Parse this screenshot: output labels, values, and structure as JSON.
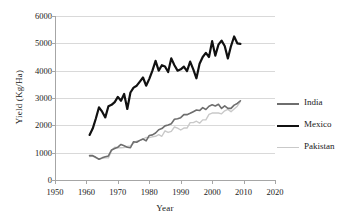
{
  "chart_data": {
    "type": "line",
    "title": "",
    "xlabel": "Year",
    "ylabel": "Yield (Kg/Ha)",
    "xlim": [
      1950,
      2020
    ],
    "ylim": [
      0,
      6000
    ],
    "xticks": [
      1950,
      1960,
      1970,
      1980,
      1990,
      2000,
      2010,
      2020
    ],
    "yticks": [
      0,
      1000,
      2000,
      3000,
      4000,
      5000,
      6000
    ],
    "grid": "horizontal",
    "legend_position": "right",
    "x": [
      1961,
      1962,
      1963,
      1964,
      1965,
      1966,
      1967,
      1968,
      1969,
      1970,
      1971,
      1972,
      1973,
      1974,
      1975,
      1976,
      1977,
      1978,
      1979,
      1980,
      1981,
      1982,
      1983,
      1984,
      1985,
      1986,
      1987,
      1988,
      1989,
      1990,
      1991,
      1992,
      1993,
      1994,
      1995,
      1996,
      1997,
      1998,
      1999,
      2000,
      2001,
      2002,
      2003,
      2004,
      2005,
      2006,
      2007,
      2008,
      2009
    ],
    "series": [
      {
        "name": "India",
        "color": "#6e6e6e",
        "width": 1.6,
        "values": [
          890,
          890,
          830,
          760,
          810,
          850,
          880,
          1100,
          1150,
          1200,
          1300,
          1250,
          1200,
          1180,
          1400,
          1380,
          1450,
          1500,
          1430,
          1630,
          1650,
          1720,
          1840,
          1880,
          1980,
          2010,
          2060,
          2220,
          2240,
          2280,
          2390,
          2390,
          2440,
          2500,
          2560,
          2540,
          2650,
          2580,
          2700,
          2750,
          2710,
          2770,
          2620,
          2710,
          2620,
          2620,
          2740,
          2800,
          2900
        ]
      },
      {
        "name": "Mexico",
        "color": "#111111",
        "width": 2.2,
        "values": [
          1650,
          1880,
          2250,
          2660,
          2500,
          2290,
          2700,
          2750,
          2850,
          3040,
          2900,
          3150,
          2600,
          3200,
          3380,
          3450,
          3600,
          3750,
          3450,
          3700,
          4000,
          4360,
          4000,
          4200,
          4150,
          3950,
          4450,
          4200,
          4000,
          4050,
          4150,
          3980,
          4330,
          4050,
          3720,
          4250,
          4500,
          4650,
          4500,
          5080,
          4550,
          4950,
          5100,
          4900,
          4450,
          4900,
          5250,
          5000,
          4980
        ]
      },
      {
        "name": "Pakistan",
        "color": "#c9c9c9",
        "width": 1.4,
        "values": [
          860,
          880,
          810,
          760,
          790,
          810,
          810,
          1080,
          1200,
          1180,
          1180,
          1190,
          1230,
          1250,
          1350,
          1420,
          1450,
          1500,
          1560,
          1550,
          1580,
          1600,
          1660,
          1600,
          1800,
          1740,
          1780,
          1940,
          1900,
          1830,
          1900,
          1900,
          2100,
          2100,
          2150,
          2080,
          2200,
          2200,
          2400,
          2450,
          2450,
          2450,
          2420,
          2530,
          2580,
          2500,
          2600,
          2700,
          2880
        ]
      }
    ]
  },
  "legend": {
    "items": [
      {
        "label": "India"
      },
      {
        "label": "Mexico"
      },
      {
        "label": "Pakistan"
      }
    ]
  }
}
